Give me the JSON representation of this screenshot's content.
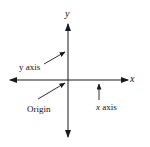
{
  "diagram": {
    "type": "coordinate-axes",
    "axis_labels": {
      "x": "x",
      "y": "y"
    },
    "annotations": {
      "y_axis": {
        "letter": "y",
        "word": " axis"
      },
      "x_axis": {
        "letter": "x",
        "word": " axis"
      },
      "origin": "Origin"
    },
    "colors": {
      "line": "#1a1a1a",
      "text": "#111111",
      "background": "#ffffff"
    }
  }
}
